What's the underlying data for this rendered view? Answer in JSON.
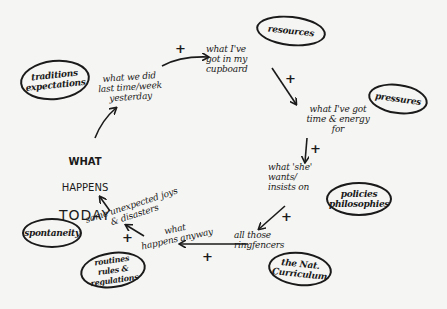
{
  "diagram": {
    "center": {
      "line1": "WHAT",
      "line2": "HAPPENS",
      "line3": "TODAY"
    },
    "steps": [
      {
        "id": "cupboard",
        "text": "what I've\ngot in my\ncupboard"
      },
      {
        "id": "time-energy",
        "text": "what I've got\ntime & energy\nfor"
      },
      {
        "id": "she-wants",
        "text": "what 'she'\nwants/\ninsists on"
      },
      {
        "id": "ringfencers",
        "text": "all those\nringfencers"
      },
      {
        "id": "anyway",
        "text": "what\nhappens anyway"
      },
      {
        "id": "unexpected",
        "text": "some unexpected joys\n& disasters"
      },
      {
        "id": "last-time",
        "text": "what we did\nlast time/week\nyesterday"
      }
    ],
    "factors": [
      {
        "id": "resources",
        "text": "resources"
      },
      {
        "id": "pressures",
        "text": "pressures"
      },
      {
        "id": "policies",
        "text": "policies\nphilosophies"
      },
      {
        "id": "curriculum",
        "text": "the Nat.\nCurriculum"
      },
      {
        "id": "routines",
        "text": "routines\nrules & regulations"
      },
      {
        "id": "spontaneity",
        "text": "spontaneity"
      },
      {
        "id": "traditions",
        "text": "traditions\nexpectations"
      }
    ],
    "link_sign": "+",
    "ink_color": "#1a1a1a",
    "paper_color": "#f5f5f3"
  }
}
